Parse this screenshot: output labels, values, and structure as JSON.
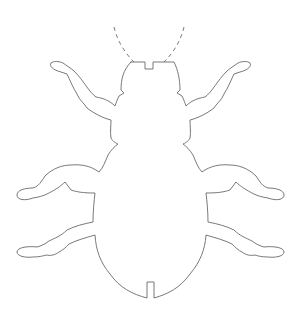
{
  "figure": {
    "stroke_color": "#6a6a6a",
    "background": "#ffffff",
    "parts": [
      "antennae",
      "head",
      "thorax",
      "abdomen",
      "legs"
    ]
  }
}
